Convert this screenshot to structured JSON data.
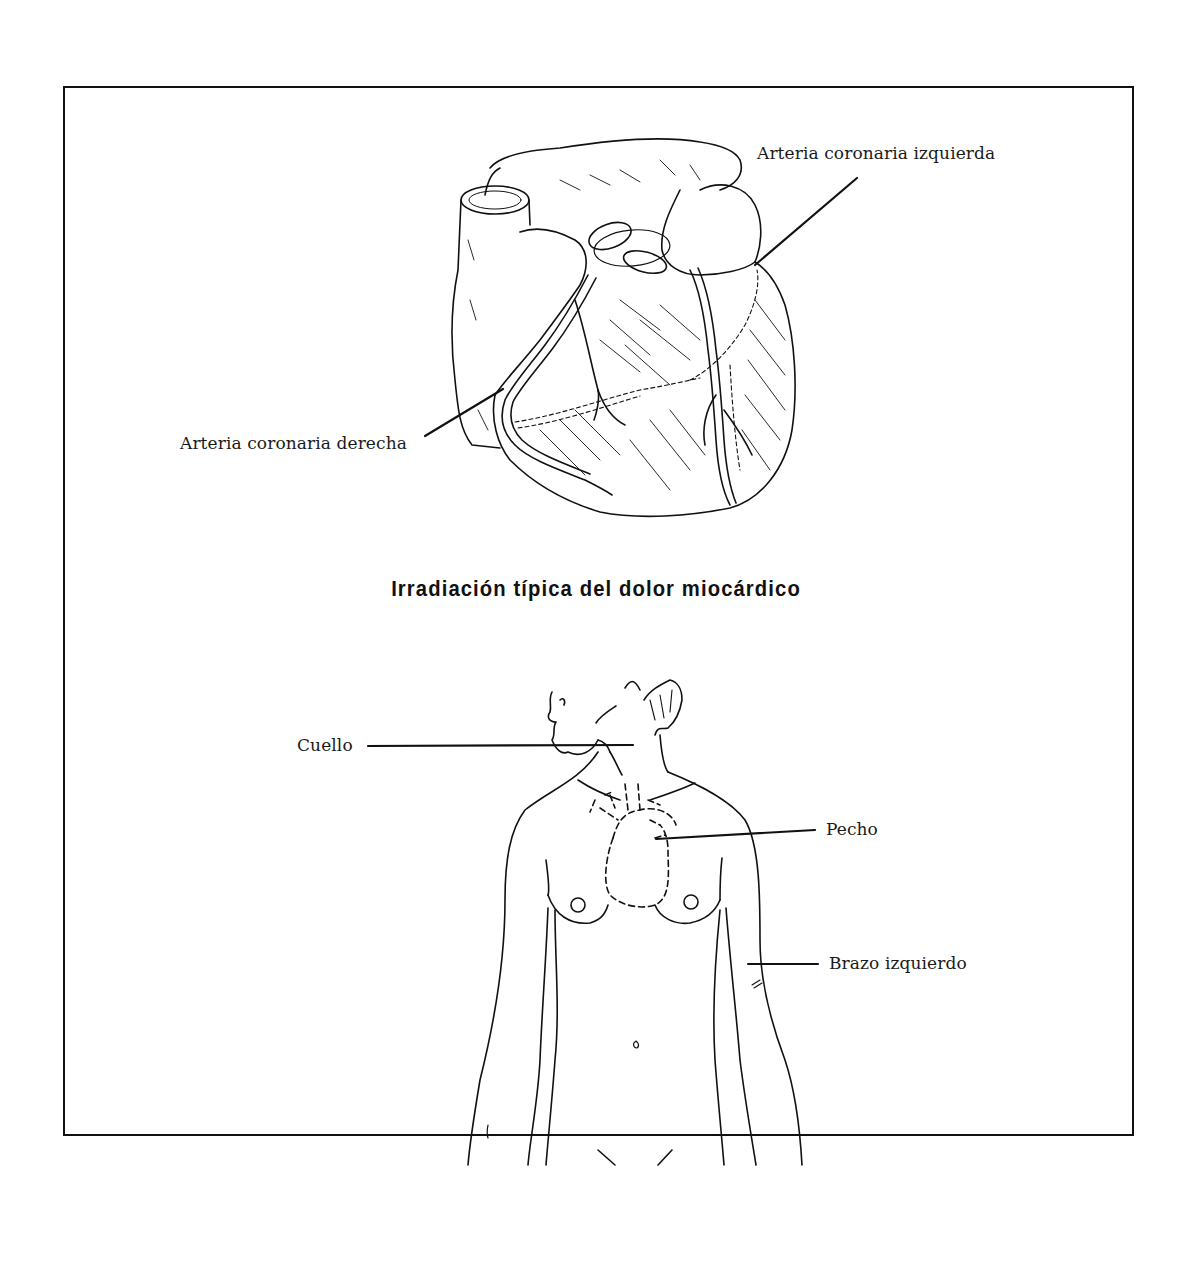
{
  "figure": {
    "title": "Irradiación típica del dolor miocárdico",
    "heart_labels": {
      "left_coronary": "Arteria coronaria izquierda",
      "right_coronary": "Arteria coronaria derecha"
    },
    "body_labels": {
      "neck": "Cuello",
      "chest": "Pecho",
      "left_arm": "Brazo izquierdo"
    },
    "colors": {
      "ink": "#111111",
      "background": "#ffffff"
    }
  }
}
